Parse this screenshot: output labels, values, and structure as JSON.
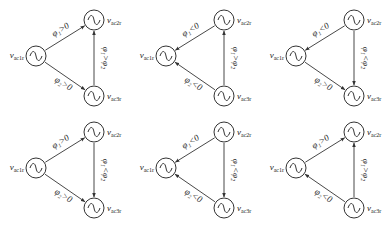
{
  "colors": {
    "stroke": "#333333",
    "text": "#222222",
    "background": "#ffffff"
  },
  "panels": [
    {
      "id": "a",
      "left": {
        "label": "v",
        "sub": "ac1r"
      },
      "top": {
        "label": "v",
        "sub": "ac2r"
      },
      "bottom": {
        "label": "v",
        "sub": "ac3r"
      },
      "edge_top": {
        "text": "φ₁>0",
        "dir": "to-top"
      },
      "edge_bottom": {
        "text": "φ₂>0",
        "dir": "to-bottom"
      },
      "edge_vert": {
        "text": "φ₁>φ₂",
        "dir": "up"
      }
    },
    {
      "id": "b",
      "left": {
        "label": "v",
        "sub": "ac1r"
      },
      "top": {
        "label": "v",
        "sub": "ac2r"
      },
      "bottom": {
        "label": "v",
        "sub": "ac3r"
      },
      "edge_top": {
        "text": "φ₁<0",
        "dir": "to-left"
      },
      "edge_bottom": {
        "text": "φ₂<0",
        "dir": "to-left"
      },
      "edge_vert": {
        "text": "φ₁>φ₂",
        "dir": "up"
      }
    },
    {
      "id": "c",
      "left": {
        "label": "v",
        "sub": "ac1r"
      },
      "top": {
        "label": "v",
        "sub": "ac2r"
      },
      "bottom": {
        "label": "v",
        "sub": "ac3r"
      },
      "edge_top": {
        "text": "φ₁<0",
        "dir": "to-left"
      },
      "edge_bottom": {
        "text": "φ₂>0",
        "dir": "to-bottom"
      },
      "edge_vert": {
        "text": "φ₁<φ₂",
        "dir": "down"
      }
    },
    {
      "id": "d",
      "left": {
        "label": "v",
        "sub": "ac1r"
      },
      "top": {
        "label": "v",
        "sub": "ac2r"
      },
      "bottom": {
        "label": "v",
        "sub": "ac3r"
      },
      "edge_top": {
        "text": "φ₁>0",
        "dir": "to-top"
      },
      "edge_bottom": {
        "text": "φ₂>0",
        "dir": "to-bottom"
      },
      "edge_vert": {
        "text": "φ₁<φ₂",
        "dir": "down"
      }
    },
    {
      "id": "e",
      "left": {
        "label": "v",
        "sub": "ac1r"
      },
      "top": {
        "label": "v",
        "sub": "ac2r"
      },
      "bottom": {
        "label": "v",
        "sub": "ac3r"
      },
      "edge_top": {
        "text": "φ₁<0",
        "dir": "to-left"
      },
      "edge_bottom": {
        "text": "φ₂<0",
        "dir": "to-left"
      },
      "edge_vert": {
        "text": "φ₁<φ₂",
        "dir": "down"
      }
    },
    {
      "id": "f",
      "left": {
        "label": "v",
        "sub": "ac1r"
      },
      "top": {
        "label": "v",
        "sub": "ac2r"
      },
      "bottom": {
        "label": "v",
        "sub": "ac3r"
      },
      "edge_top": {
        "text": "φ₁>0",
        "dir": "to-top"
      },
      "edge_bottom": {
        "text": "φ₂<0",
        "dir": "to-left"
      },
      "edge_vert": {
        "text": "φ₁>φ₂",
        "dir": "up"
      }
    }
  ]
}
